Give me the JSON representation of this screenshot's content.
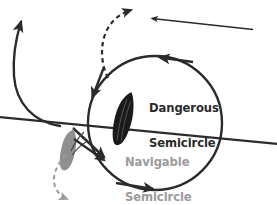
{
  "diagram": {
    "type": "navigational-diagram",
    "canvas": {
      "width": 277,
      "height": 205,
      "background": "#ffffff"
    },
    "colors": {
      "stroke_dark": "#2b2b2b",
      "text_dark": "#2b2b2b",
      "text_gray": "#9b9b9b",
      "vessel_dark": "#1a1a1a",
      "vessel_gray": "#8f8f8f",
      "dashed_gray": "#9b9b9b"
    },
    "labels": {
      "dangerous": {
        "line1": "Dangerous",
        "line2": "Semicircle",
        "color": "#2b2b2b"
      },
      "navigable": {
        "line1": "Navigable",
        "line2": "Semicircle",
        "color": "#9b9b9b"
      }
    },
    "storm_circle": {
      "name": "storm-circle",
      "center_x": 155,
      "center_y": 123,
      "radius": 67,
      "stroke_width": 2.4,
      "rotation_arrows": 4,
      "rotation_direction": "counter-clockwise"
    },
    "track_line": {
      "name": "storm-track-line",
      "x1": 0,
      "y1": 118,
      "x2": 277,
      "y2": 144,
      "stroke_width": 2.2
    },
    "wind_arrow_top": {
      "name": "wind-arrow-top",
      "x1": 252,
      "y1": 29,
      "x2": 153,
      "y2": 18,
      "direction": "left"
    },
    "vessel_dark": {
      "name": "vessel-dangerous-semicircle",
      "x": 123,
      "y": 90,
      "fill": "#1a1a1a"
    },
    "vessel_gray": {
      "name": "vessel-navigable-semicircle",
      "x": 67,
      "y": 130,
      "fill": "#8f8f8f"
    },
    "escape_track_dark": {
      "name": "escape-track-dark-solid",
      "description": "solid curved track exiting upper-left with arrowhead"
    },
    "escape_track_dashed": {
      "name": "escape-track-dashed-upper",
      "description": "dashed curved track rising to upper centre with arrowhead"
    },
    "approach_track_dashed": {
      "name": "approach-track-dashed-lower",
      "description": "dashed curved track descending lower-left with arrowhead"
    }
  }
}
